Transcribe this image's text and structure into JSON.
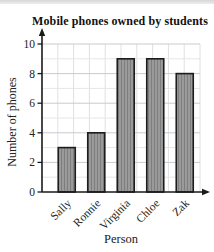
{
  "page": {
    "background": "#ffffff",
    "top_strip_color": "#d9d9d9"
  },
  "chart_data": {
    "type": "bar",
    "title": "Mobile phones owned by students",
    "xlabel": "Person",
    "ylabel": "Number of phones",
    "categories": [
      "Sally",
      "Ronnie",
      "Virginia",
      "Chloe",
      "Zak"
    ],
    "values": [
      3,
      4,
      9,
      9,
      8
    ],
    "ylim": [
      0,
      10
    ],
    "ytick_step": 2,
    "yticks": [
      "0",
      "2",
      "4",
      "6",
      "8",
      "10"
    ],
    "grid": "on",
    "legend": "none",
    "colors": {
      "bar_fill": "#9a9a9a",
      "bar_stripe": "#7e7e7e",
      "bar_border": "#1c1c1c",
      "axis": "#1a1a1a",
      "grid_major": "#c7cbcf",
      "grid_minor": "#e3e6e8",
      "grid_vertical": "#dde0e3",
      "tick_text": "#222222"
    }
  }
}
